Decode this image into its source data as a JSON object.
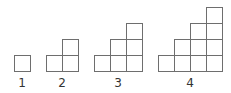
{
  "diagram": {
    "cell_size_px": 16,
    "line_color": "#6e6e6e",
    "baseline_y": 71,
    "figures": [
      {
        "label": "1",
        "steps": 1,
        "left": 14,
        "label_x": 22,
        "total_squares": 1
      },
      {
        "label": "2",
        "steps": 2,
        "left": 46,
        "label_x": 62,
        "total_squares": 3
      },
      {
        "label": "3",
        "steps": 3,
        "left": 94,
        "label_x": 118,
        "total_squares": 6
      },
      {
        "label": "4",
        "steps": 4,
        "left": 158,
        "label_x": 190,
        "total_squares": 10
      }
    ]
  }
}
